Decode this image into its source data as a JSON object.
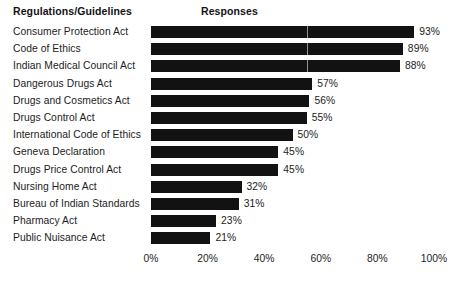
{
  "header": {
    "categories_title": "Regulations/Guidelines",
    "values_title": "Responses"
  },
  "chart_data": {
    "type": "bar",
    "orientation": "horizontal",
    "title": "",
    "subtitle": "",
    "xlabel": "Responses",
    "ylabel": "Regulations/Guidelines",
    "xlim": [
      0,
      100
    ],
    "xticks": [
      "0%",
      "20%",
      "40%",
      "60%",
      "80%",
      "100%"
    ],
    "xtick_values": [
      0,
      20,
      40,
      60,
      80,
      100
    ],
    "grid": false,
    "legend": null,
    "value_suffix": "%",
    "bar_color": "#121212",
    "background_color": "#ffffff",
    "categories": [
      "Consumer Protection Act",
      "Code of Ethics",
      "Indian Medical Council Act",
      "Dangerous Drugs Act",
      "Drugs and Cosmetics Act",
      "Drugs Control Act",
      "International Code of Ethics",
      "Geneva Declaration",
      "Drugs Price Control Act",
      "Nursing Home Act",
      "Bureau of Indian Standards",
      "Pharmacy Act",
      "Public Nuisance Act"
    ],
    "values": [
      93,
      89,
      88,
      57,
      56,
      55,
      50,
      45,
      45,
      32,
      31,
      23,
      21
    ],
    "value_labels": [
      "93%",
      "89%",
      "88%",
      "57%",
      "56%",
      "55%",
      "50%",
      "45%",
      "45%",
      "32%",
      "31%",
      "23%",
      "21%"
    ]
  }
}
